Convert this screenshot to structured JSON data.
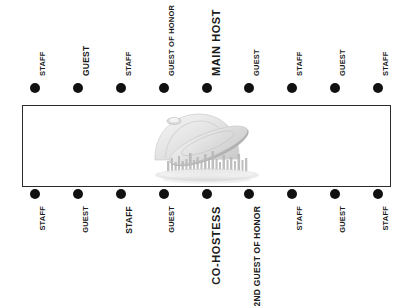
{
  "diagram": {
    "table_shape": "rectangle",
    "colors": {
      "background": "#ffffff",
      "table_border": "#2b2b2b",
      "seat_dot": "#111111",
      "label_text": "#1a1a1a"
    },
    "watermark": {
      "name": "serving-dome-logo",
      "description": "faded grayscale serving cloche with lifted lid over illegible script text",
      "opacity": "0.62"
    },
    "seats_top": [
      {
        "label": "STAFF",
        "size": "small"
      },
      {
        "label": "GUEST",
        "size": "medium"
      },
      {
        "label": "STAFF",
        "size": "small"
      },
      {
        "label": "GUEST OF HONOR",
        "size": "small"
      },
      {
        "label": "MAIN HOST",
        "size": "large"
      },
      {
        "label": "GUEST",
        "size": "small"
      },
      {
        "label": "STAFF",
        "size": "small"
      },
      {
        "label": "GUEST",
        "size": "small"
      },
      {
        "label": "STAFF",
        "size": "small"
      }
    ],
    "seats_bottom": [
      {
        "label": "STAFF",
        "size": "small"
      },
      {
        "label": "GUEST",
        "size": "small"
      },
      {
        "label": "STAFF",
        "size": "medium"
      },
      {
        "label": "GUEST",
        "size": "small"
      },
      {
        "label": "CO-HOSTESS",
        "size": "large"
      },
      {
        "label": "2ND GUEST OF HONOR",
        "size": "medium"
      },
      {
        "label": "STAFF",
        "size": "small"
      },
      {
        "label": "GUEST",
        "size": "small"
      },
      {
        "label": "STAFF",
        "size": "small"
      }
    ]
  }
}
